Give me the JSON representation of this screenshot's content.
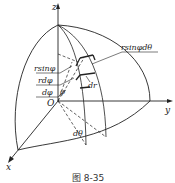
{
  "figure": {
    "caption": "图 8-35",
    "axes": {
      "z": "z",
      "y": "y",
      "x": "x",
      "origin": "O"
    },
    "labels": {
      "r_sin_phi_dtheta": "rsinφdθ",
      "r_sin_phi": "rsinφ",
      "r_dphi": "rdφ",
      "dphi": "dφ",
      "dr": "dr",
      "phi": "φ",
      "dtheta": "dθ"
    },
    "colors": {
      "line": "#222222",
      "background": "#ffffff"
    }
  }
}
